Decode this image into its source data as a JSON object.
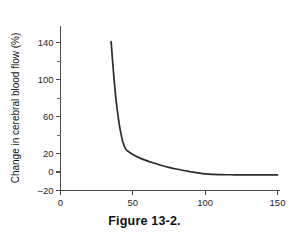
{
  "figure": {
    "caption": "Figure 13-2."
  },
  "chart_data": {
    "type": "line",
    "title": "",
    "subtitle": "",
    "xlabel": "",
    "ylabel": "Change in cerebral blood flow (%)",
    "xlim": [
      0,
      155
    ],
    "ylim": [
      -20,
      150
    ],
    "grid": false,
    "legend": null,
    "x_ticks": [
      0,
      50,
      100,
      150
    ],
    "x_tick_labels": [
      "0",
      "50",
      "100",
      "150"
    ],
    "y_ticks": [
      -20,
      0,
      20,
      40,
      60,
      80,
      100,
      120,
      140
    ],
    "y_tick_labels": [
      "-20",
      "0",
      "20",
      "",
      "60",
      "",
      "100",
      "",
      "140"
    ],
    "y_labeled_ticks": [
      -20,
      0,
      20,
      60,
      100,
      140
    ],
    "series": [
      {
        "name": "Change in cerebral blood flow",
        "color": "#2b2b2b",
        "x": [
          35,
          36,
          37,
          38,
          39,
          40,
          41,
          42,
          43,
          45,
          47,
          50,
          55,
          60,
          65,
          70,
          75,
          80,
          85,
          90,
          95,
          100,
          110,
          120,
          130,
          140,
          150
        ],
        "y": [
          141,
          120,
          101,
          84,
          70,
          58,
          48,
          40,
          33,
          25,
          22,
          19,
          15,
          12,
          9.5,
          7,
          5,
          3.2,
          1.6,
          0.3,
          -1,
          -2,
          -2.8,
          -3,
          -3,
          -3,
          -3
        ]
      }
    ]
  },
  "axis": {
    "y_title": "Change in cerebral blood flow (%)"
  }
}
